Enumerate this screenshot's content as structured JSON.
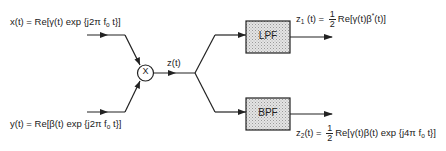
{
  "diagram": {
    "type": "block-diagram",
    "inputs": {
      "x": {
        "prefix": "x(t) = Re[",
        "envelope": "γ(t)",
        "mid": " exp {j2π f",
        "sub": "o",
        "suffix": " t}]"
      },
      "y": {
        "prefix": "y(t) = Re[",
        "envelope": "β(t)",
        "mid": " exp {j2π f",
        "sub": "o",
        "suffix": " t}]"
      }
    },
    "multiplier": {
      "symbol": "X"
    },
    "product_label": "z(t)",
    "filters": {
      "lpf": {
        "label": "LPF"
      },
      "bpf": {
        "label": "BPF"
      }
    },
    "outputs": {
      "z1": {
        "name": "z",
        "sub": "1",
        "arg": " (t) =",
        "frac_num": "1",
        "frac_den": "2",
        "expr_a": "Re[γ(t)β",
        "sup": "*",
        "expr_b": "(t)]"
      },
      "z2": {
        "name": "z",
        "sub": "2",
        "arg": "(t) =",
        "frac_num": "1",
        "frac_den": "2",
        "expr_a": "Re[γ(t)β(t) exp {j4π f",
        "sub2": "o",
        "expr_b": " t}]"
      }
    },
    "colors": {
      "line": "#222222",
      "box_fill": "#d9d9d9",
      "background": "#ffffff"
    }
  }
}
